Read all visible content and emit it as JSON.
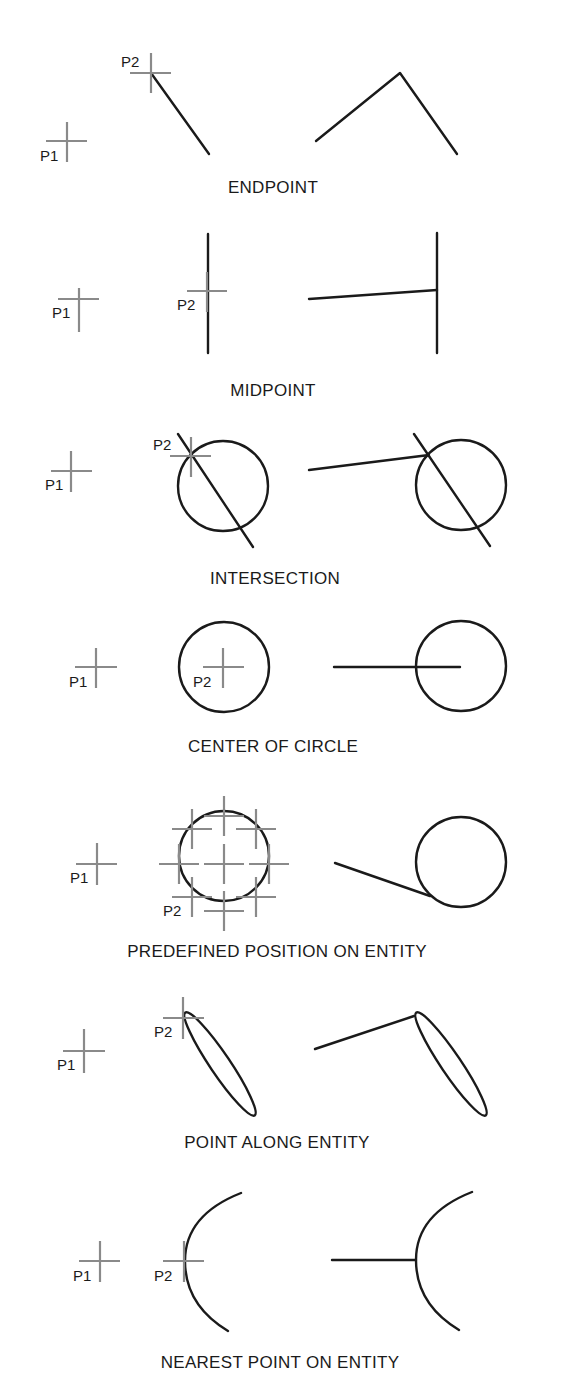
{
  "diagram": {
    "colors": {
      "entity": "#1a1a1a",
      "cursor_cross": "#8a8a8a",
      "text": "#1a1a1a",
      "background": "#ffffff"
    },
    "panels": [
      {
        "id": "endpoint",
        "caption": "ENDPOINT",
        "p1_label": "P1",
        "p2_label": "P2"
      },
      {
        "id": "midpoint",
        "caption": "MIDPOINT",
        "p1_label": "P1",
        "p2_label": "P2"
      },
      {
        "id": "intersection",
        "caption": "INTERSECTION",
        "p1_label": "P1",
        "p2_label": "P2"
      },
      {
        "id": "center-of-circle",
        "caption": "CENTER OF CIRCLE",
        "p1_label": "P1",
        "p2_label": "P2"
      },
      {
        "id": "predefined-position",
        "caption": "PREDEFINED POSITION ON ENTITY",
        "p1_label": "P1",
        "p2_label": "P2"
      },
      {
        "id": "point-along-entity",
        "caption": "POINT ALONG ENTITY",
        "p1_label": "P1",
        "p2_label": "P2"
      },
      {
        "id": "nearest-point",
        "caption": "NEAREST POINT ON ENTITY",
        "p1_label": "P1",
        "p2_label": "P2"
      }
    ]
  }
}
